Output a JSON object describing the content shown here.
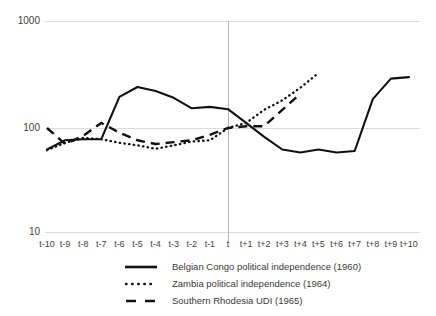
{
  "chart_data": {
    "type": "line",
    "title": "",
    "xlabel": "",
    "ylabel": "",
    "yscale": "log",
    "ylim": [
      10,
      1000
    ],
    "ytick_labels": [
      "1000",
      "100",
      "10"
    ],
    "ytick_values": [
      1000,
      100,
      10
    ],
    "grid": true,
    "legend_position": "bottom",
    "annotations": [
      "vertical reference line at t (event year)"
    ],
    "categories": [
      "t-10",
      "t-9",
      "t-8",
      "t-7",
      "t-6",
      "t-5",
      "t-4",
      "t-3",
      "t-2",
      "t-1",
      "t",
      "t+1",
      "t+2",
      "t+3",
      "t+4",
      "t+5",
      "t+6",
      "t+7",
      "t+8",
      "t+9",
      "t+10"
    ],
    "series": [
      {
        "name": "Belgian Congo political independence (1960)",
        "style": "solid",
        "values": [
          62,
          76,
          78,
          78,
          200,
          249,
          228,
          196,
          155,
          160,
          152,
          112,
          82,
          62,
          58,
          62,
          58,
          60,
          190,
          300,
          310
        ]
      },
      {
        "name": "Zambia political independence (1964)",
        "style": "dotted",
        "values": [
          61,
          72,
          80,
          78,
          72,
          68,
          63,
          68,
          74,
          76,
          100,
          112,
          150,
          185,
          245,
          340,
          null,
          null,
          null,
          null,
          null
        ]
      },
      {
        "name": "Southern Rhodesia UDI (1965)",
        "style": "dashed",
        "values": [
          100,
          70,
          84,
          112,
          90,
          76,
          70,
          73,
          76,
          86,
          100,
          104,
          104,
          150,
          215,
          null,
          null,
          null,
          null,
          null,
          null
        ]
      }
    ]
  },
  "legend": {
    "items": [
      {
        "label": "Belgian Congo political independence (1960)",
        "key": "solid-line-key"
      },
      {
        "label": "Zambia political independence (1964)",
        "key": "dotted-line-key"
      },
      {
        "label": "Southern Rhodesia UDI (1965)",
        "key": "dashed-line-key"
      }
    ]
  }
}
